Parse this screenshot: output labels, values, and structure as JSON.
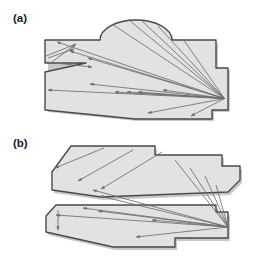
{
  "figure": {
    "name": "visibility-ray-diagram",
    "background_color": "#ffffff",
    "panel_count": 2
  },
  "style": {
    "polygon_fill": "#e2e2e2",
    "polygon_stroke": "#4a4a4a",
    "polygon_stroke_width": 1.4,
    "ray_stroke": "#6e6e6e",
    "ray_stroke_width": 0.85,
    "shadow_fill": "#9a9a9a",
    "label_color": "#1a1a1a"
  },
  "panels": [
    {
      "id": "a",
      "label": "(a)",
      "label_x": 13,
      "label_y": 22,
      "description": "single connected polygon with domed top and left slit notch",
      "source_point": {
        "x": 224.5,
        "y": 98.5
      },
      "shapes": [
        {
          "name": "main-polygon-a",
          "points": "45,40 45,63 86,63 45,72 45,110 135,119 212,119 212,110 228,110 228,68 216,68 216,40 172,40 136,21 100,40",
          "dome": {
            "cx": 136,
            "cy": 40,
            "rx": 36,
            "ry": 20,
            "peak_y": 20
          }
        }
      ],
      "rays": [
        {
          "from": [
            224.5,
            98.5
          ],
          "to": [
            57,
            42
          ],
          "arrow": "to"
        },
        {
          "from": [
            224.5,
            98.5
          ],
          "to": [
            70,
            51
          ],
          "arrow": "to"
        },
        {
          "from": [
            224.5,
            98.5
          ],
          "to": [
            88,
            58
          ],
          "arrow": "to"
        },
        {
          "from": [
            224.5,
            98.5
          ],
          "to": [
            48,
            90
          ],
          "arrow": "to"
        },
        {
          "from": [
            224.5,
            98.5
          ],
          "to": [
            90,
            84
          ],
          "arrow": "to"
        },
        {
          "from": [
            224.5,
            98.5
          ],
          "to": [
            115,
            92
          ],
          "arrow": "to"
        },
        {
          "from": [
            224.5,
            98.5
          ],
          "to": [
            127,
            92
          ],
          "arrow": "to"
        },
        {
          "from": [
            224.5,
            98.5
          ],
          "to": [
            138,
            92
          ],
          "arrow": "to"
        },
        {
          "from": [
            224.5,
            98.5
          ],
          "to": [
            163,
            90
          ],
          "arrow": "to"
        },
        {
          "from": [
            224.5,
            98.5
          ],
          "to": [
            148,
            113
          ],
          "arrow": "to"
        },
        {
          "from": [
            224.5,
            98.5
          ],
          "to": [
            191,
            116
          ],
          "arrow": "to"
        },
        {
          "from": [
            224.5,
            98.5
          ],
          "to": [
            112,
            24
          ],
          "arrow": "none"
        },
        {
          "from": [
            224.5,
            98.5
          ],
          "to": [
            130,
            21
          ],
          "arrow": "none"
        },
        {
          "from": [
            224.5,
            98.5
          ],
          "to": [
            142,
            21
          ],
          "arrow": "none"
        },
        {
          "from": [
            224.5,
            98.5
          ],
          "to": [
            158,
            26
          ],
          "arrow": "none"
        },
        {
          "from": [
            224.5,
            98.5
          ],
          "to": [
            183,
            39
          ],
          "arrow": "none"
        },
        {
          "from": [
            52,
            62
          ],
          "to": [
            76,
            44
          ],
          "arrow": "to"
        },
        {
          "from": [
            48,
            58
          ],
          "to": [
            74,
            49
          ],
          "arrow": "to"
        },
        {
          "from": [
            46,
            62
          ],
          "to": [
            92,
            67
          ],
          "arrow": "to"
        },
        {
          "from": [
            76,
            44
          ],
          "to": [
            46,
            56
          ],
          "arrow": "none"
        }
      ],
      "arrow_count": 15
    },
    {
      "id": "b",
      "label": "(b)",
      "label_x": 13,
      "label_y": 147,
      "description": "two disjoint polygons separated by a wedge gap, rays cross the gap",
      "source_point": {
        "x": 228,
        "y": 227
      },
      "shapes": [
        {
          "name": "upper-polygon-b",
          "points": "71,159 52,175 52,190 67,200 101,196 152,190 228,190 228,183 240,178 240,166 222,166 222,155 155,155 155,146 71,146",
          "simplified": "71,146 155,146 155,155 222,155 222,166 240,166 240,180 228,192 101,197 52,190 52,172"
        },
        {
          "name": "lower-polygon-b",
          "points": "56,205 46,216 46,232 113,247 175,247 175,238 228,238 228,212 216,212 216,205"
        }
      ],
      "rays": [
        {
          "from": [
            228,
            227
          ],
          "to": [
            56,
            215
          ],
          "arrow": "to"
        },
        {
          "from": [
            228,
            227
          ],
          "to": [
            83,
            208
          ],
          "arrow": "to"
        },
        {
          "from": [
            228,
            227
          ],
          "to": [
            98,
            211
          ],
          "arrow": "to"
        },
        {
          "from": [
            228,
            227
          ],
          "to": [
            100,
            196
          ],
          "arrow": "to"
        },
        {
          "from": [
            228,
            227
          ],
          "to": [
            152,
            220
          ],
          "arrow": "to"
        },
        {
          "from": [
            228,
            227
          ],
          "to": [
            136,
            237
          ],
          "arrow": "to"
        },
        {
          "from": [
            228,
            227
          ],
          "to": [
            93,
            190
          ],
          "arrow": "to"
        },
        {
          "from": [
            228,
            227
          ],
          "to": [
            175,
            160
          ],
          "arrow": "none"
        },
        {
          "from": [
            228,
            227
          ],
          "to": [
            190,
            168
          ],
          "arrow": "none"
        },
        {
          "from": [
            228,
            227
          ],
          "to": [
            205,
            176
          ],
          "arrow": "none"
        },
        {
          "from": [
            228,
            227
          ],
          "to": [
            216,
            185
          ],
          "arrow": "none"
        },
        {
          "from": [
            104,
            148
          ],
          "to": [
            55,
            168
          ],
          "arrow": "to"
        },
        {
          "from": [
            133,
            150
          ],
          "to": [
            78,
            181
          ],
          "arrow": "to"
        },
        {
          "from": [
            162,
            152
          ],
          "to": [
            101,
            189
          ],
          "arrow": "to"
        },
        {
          "from": [
            58,
            210
          ],
          "to": [
            58,
            230
          ],
          "arrow": "to"
        }
      ],
      "arrow_count": 12
    }
  ]
}
